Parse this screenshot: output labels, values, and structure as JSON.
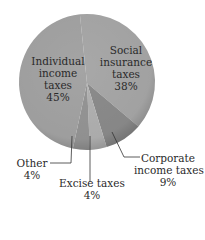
{
  "chart_data": {
    "type": "pie",
    "title": "",
    "slices": [
      {
        "label": "Social insurance taxes",
        "value": 38,
        "display": "38%",
        "color": "#a8a8a8"
      },
      {
        "label": "Corporate income taxes",
        "value": 9,
        "display": "9%",
        "color": "#8c8c8c"
      },
      {
        "label": "Excise taxes",
        "value": 4,
        "display": "4%",
        "color": "#b2b2b2"
      },
      {
        "label": "Other",
        "value": 4,
        "display": "4%",
        "color": "#969696"
      },
      {
        "label": "Individual income taxes",
        "value": 45,
        "display": "45%",
        "color": "#a4a4a4"
      }
    ],
    "legend": "none (labels on/near slices)"
  },
  "labels": {
    "individual": {
      "l1": "Individual",
      "l2": "income",
      "l3": "taxes",
      "pct": "45%"
    },
    "social": {
      "l1": "Social",
      "l2": "insurance",
      "l3": "taxes",
      "pct": "38%"
    },
    "corporate": {
      "l1": "Corporate",
      "l2": "income taxes",
      "pct": "9%"
    },
    "excise": {
      "l1": "Excise taxes",
      "pct": "4%"
    },
    "other": {
      "l1": "Other",
      "pct": "4%"
    }
  }
}
